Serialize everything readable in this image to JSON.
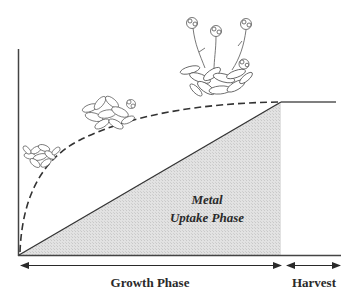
{
  "diagram": {
    "type": "phytoextraction-growth-timeline",
    "region_label_line1": "Metal",
    "region_label_line2": "Uptake Phase",
    "phase_labels": {
      "growth": "Growth Phase",
      "harvest": "Harvest"
    },
    "curves": [
      {
        "name": "biomass-growth",
        "style": "dashed",
        "shape": "saturating"
      },
      {
        "name": "metal-accumulation",
        "style": "solid",
        "shape": "linear"
      }
    ],
    "illustrations": [
      {
        "name": "seedling-plant",
        "stage": "early"
      },
      {
        "name": "rosette-plant",
        "stage": "mid"
      },
      {
        "name": "flowering-plant",
        "stage": "mature"
      }
    ],
    "colors": {
      "line": "#3a3a3a",
      "shade": "#dcdcdc",
      "text": "#2a2a2a"
    }
  }
}
